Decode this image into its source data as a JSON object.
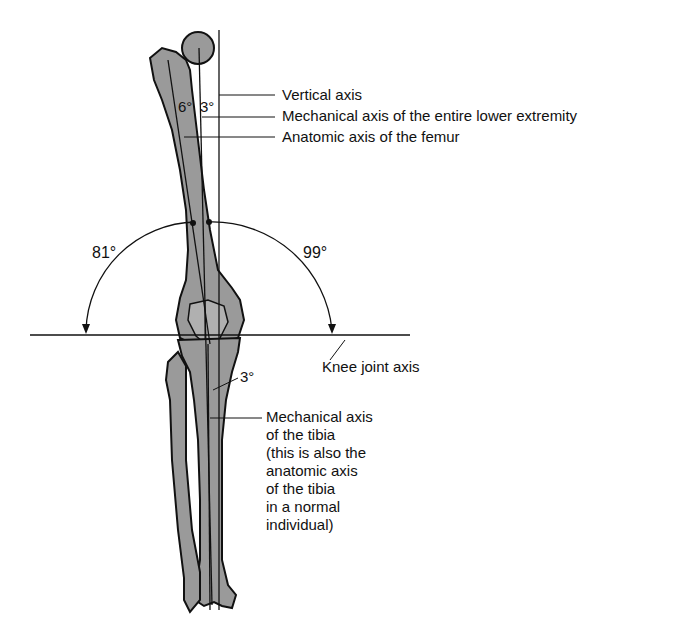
{
  "labels": {
    "vertical_axis": "Vertical axis",
    "mech_axis_lower": "Mechanical axis of the entire lower extremity",
    "anatomic_axis_femur": "Anatomic axis of the femur",
    "knee_joint_axis": "Knee joint axis",
    "mech_axis_tibia": [
      "Mechanical axis",
      "of the tibia",
      "(this is also the",
      "anatomic axis",
      "of the tibia",
      "in a normal",
      "individual)"
    ]
  },
  "angles": {
    "femur_anatomic_to_mechanical": "6°",
    "mechanical_to_vertical": "3°",
    "medial_knee": "81°",
    "lateral_knee": "99°",
    "tibia": "3°"
  },
  "colors": {
    "bone_fill": "#9a9a9a",
    "outline": "#111111",
    "background": "#ffffff"
  }
}
